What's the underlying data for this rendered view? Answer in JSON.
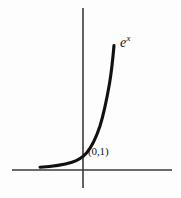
{
  "figure": {
    "kind": "hand-drawn-math-graph",
    "background_color": "#fdfdfd",
    "ink_color": "#111111",
    "axis_color": "#3a3a3c",
    "width": 181,
    "height": 198
  },
  "labels": {
    "function_base": "e",
    "function_exponent": "x",
    "intercept_point": "(0,1)"
  },
  "chart_data": {
    "type": "line",
    "title": "",
    "subtitle": "",
    "xlabel": "",
    "ylabel": "",
    "function": "y = e^x",
    "legend_entries": [
      "e^x"
    ],
    "legend_position": "inline-right-of-curve-top",
    "grid": false,
    "axes": {
      "x_axis_drawn": true,
      "y_axis_drawn": true,
      "x_axis_pixel_y": 170,
      "y_axis_pixel_x": 83,
      "x_axis_pixel_span": [
        12,
        172
      ],
      "y_axis_pixel_span": [
        8,
        188
      ],
      "xlim": [
        -2.6,
        1.6
      ],
      "ylim": [
        -0.55,
        4.6
      ],
      "tick_labels_x": [],
      "tick_labels_y": []
    },
    "annotations": [
      {
        "text": "(0,1)",
        "x": 0,
        "y": 1,
        "pixel_x": 88,
        "pixel_y": 146,
        "describes": "y-intercept of the exponential curve"
      },
      {
        "text": "e^x",
        "pixel_x": 120,
        "pixel_y": 34,
        "describes": "curve name label at the top right end of the curve"
      }
    ],
    "x": [
      -2.6,
      -2.3,
      -2.0,
      -1.7,
      -1.4,
      -1.1,
      -0.8,
      -0.5,
      -0.2,
      0.0,
      0.2,
      0.4,
      0.6,
      0.8,
      1.0,
      1.15
    ],
    "values": [
      0.074,
      0.1,
      0.135,
      0.183,
      0.247,
      0.333,
      0.449,
      0.607,
      0.819,
      1.0,
      1.221,
      1.492,
      1.822,
      2.226,
      2.718,
      3.158
    ],
    "series": [
      {
        "name": "e^x",
        "x": [
          -2.6,
          -2.3,
          -2.0,
          -1.7,
          -1.4,
          -1.1,
          -0.8,
          -0.5,
          -0.2,
          0.0,
          0.2,
          0.4,
          0.6,
          0.8,
          1.0,
          1.15
        ],
        "values": [
          0.074,
          0.1,
          0.135,
          0.183,
          0.247,
          0.333,
          0.449,
          0.607,
          0.819,
          1.0,
          1.221,
          1.492,
          1.822,
          2.226,
          2.718,
          3.158
        ],
        "color": "#111111",
        "stroke_width": 3.1
      }
    ],
    "curve_pixel_path": "M 40,167.2 C 52,166.4 64,164.6 72,162.2 C 79,160.0 83.0,157.0 86.5,153.0 C 92,146.6 96,138.0 100,126.0 C 104,113.0 107,98.0 109.6,83.0 C 111.4,72.0 113,57.0 114,45.5"
  }
}
